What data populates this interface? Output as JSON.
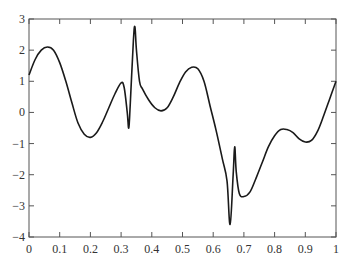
{
  "chart_data": {
    "type": "line",
    "title": "",
    "xlabel": "",
    "ylabel": "",
    "xlim": [
      0,
      1
    ],
    "ylim": [
      -4,
      3
    ],
    "grid": false,
    "legend": null,
    "x_ticks": [
      "0",
      "0.1",
      "0.2",
      "0.3",
      "0.4",
      "0.5",
      "0.6",
      "0.7",
      "0.8",
      "0.9",
      "1"
    ],
    "y_ticks": [
      "3",
      "2",
      "1",
      "0",
      "-1",
      "-2",
      "-3",
      "-4"
    ],
    "series": [
      {
        "name": "signal",
        "color": "#1a1a1a",
        "x": [
          0.0,
          0.02,
          0.04,
          0.06,
          0.08,
          0.1,
          0.12,
          0.14,
          0.16,
          0.18,
          0.2,
          0.22,
          0.24,
          0.26,
          0.28,
          0.3,
          0.31,
          0.32,
          0.325,
          0.33,
          0.34,
          0.345,
          0.35,
          0.36,
          0.37,
          0.39,
          0.41,
          0.43,
          0.45,
          0.47,
          0.49,
          0.51,
          0.53,
          0.55,
          0.57,
          0.59,
          0.61,
          0.63,
          0.645,
          0.655,
          0.665,
          0.67,
          0.675,
          0.685,
          0.7,
          0.72,
          0.74,
          0.76,
          0.78,
          0.8,
          0.82,
          0.84,
          0.86,
          0.88,
          0.9,
          0.92,
          0.94,
          0.96,
          0.98,
          1.0
        ],
        "y": [
          1.2,
          1.7,
          2.0,
          2.1,
          2.0,
          1.6,
          1.0,
          0.3,
          -0.35,
          -0.7,
          -0.8,
          -0.65,
          -0.3,
          0.15,
          0.6,
          0.95,
          0.8,
          0.0,
          -0.5,
          0.3,
          2.3,
          2.75,
          2.0,
          1.0,
          0.75,
          0.4,
          0.15,
          0.05,
          0.15,
          0.5,
          0.95,
          1.3,
          1.45,
          1.4,
          1.0,
          0.2,
          -0.6,
          -1.5,
          -2.2,
          -3.6,
          -2.0,
          -1.1,
          -1.9,
          -2.6,
          -2.7,
          -2.55,
          -2.1,
          -1.6,
          -1.1,
          -0.75,
          -0.55,
          -0.55,
          -0.65,
          -0.85,
          -0.95,
          -0.9,
          -0.6,
          -0.1,
          0.45,
          1.0
        ]
      }
    ]
  }
}
